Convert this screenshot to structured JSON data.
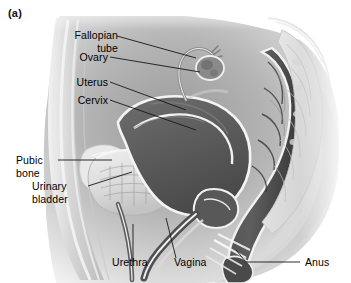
{
  "figure": {
    "letter": "(a)",
    "view": "sagittal-section-female-pelvis"
  },
  "labels": {
    "fallopian_tube": "Fallopian\ntube",
    "ovary": "Ovary",
    "uterus": "Uterus",
    "cervix": "Cervix",
    "pubic_bone": "Pubic\nbone",
    "urinary_bladder": "Urinary\nbladder",
    "urethra": "Urethra",
    "vagina": "Vagina",
    "anus": "Anus"
  },
  "colors": {
    "text": "#000000",
    "leader_line": "#1a1a1a",
    "background": "#ffffff",
    "tissue_light": "#e3e3e3",
    "tissue_mid": "#bdbdbd",
    "tissue_dark": "#6f6f6f",
    "organ_dark": "#595959",
    "organ_darkest": "#3d3d3d",
    "outline_white": "#f7f7f7"
  }
}
